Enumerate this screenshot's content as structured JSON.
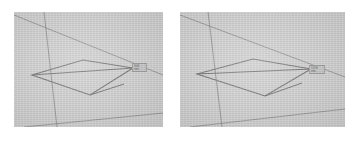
{
  "scene": {
    "title": "3D wireframe viewport pair",
    "background_color": "#ffffff",
    "viewport_fill": "#c9c9c9",
    "line_color": "#6e6e6e",
    "label_text_color": "#4a4a4a",
    "label_fill_color": "#bcbcbc"
  },
  "panels": [
    {
      "name": "left-viewport",
      "x": 14,
      "y": 12,
      "width": 149,
      "height": 115,
      "axes": [
        {
          "name": "vertical-axis",
          "x1": 30,
          "y1": 0,
          "x2": 43,
          "y2": 115
        },
        {
          "name": "horizon-diagonal",
          "x1": 0,
          "y1": 3,
          "x2": 149,
          "y2": 63
        },
        {
          "name": "ground-diagonal",
          "x1": 10,
          "y1": 115,
          "x2": 149,
          "y2": 101
        }
      ],
      "quad": {
        "name": "wireframe-quad",
        "points": "18,63 69,48 119,56 76,83"
      },
      "diagonal": {
        "name": "quad-diagonal",
        "x1": 18,
        "y1": 63,
        "x2": 119,
        "y2": 56
      },
      "spur": {
        "name": "quad-spur",
        "x1": 76,
        "y1": 83,
        "x2": 110,
        "y2": 72
      },
      "label": {
        "name": "dimension-label",
        "x": 118,
        "y": 51,
        "width": 13,
        "height": 7,
        "line1": "8.46",
        "line2": "mm"
      }
    },
    {
      "name": "right-viewport",
      "x": 180,
      "y": 12,
      "width": 165,
      "height": 115,
      "axes": [
        {
          "name": "vertical-axis",
          "x1": 28,
          "y1": 0,
          "x2": 42,
          "y2": 115
        },
        {
          "name": "horizon-diagonal",
          "x1": 0,
          "y1": 3,
          "x2": 165,
          "y2": 65
        },
        {
          "name": "ground-diagonal",
          "x1": 10,
          "y1": 115,
          "x2": 165,
          "y2": 97
        }
      ],
      "quad": {
        "name": "wireframe-quad",
        "points": "17,62 73,47 131,57 85,84"
      },
      "diagonal": {
        "name": "quad-diagonal",
        "x1": 17,
        "y1": 62,
        "x2": 131,
        "y2": 57
      },
      "spur": {
        "name": "quad-spur",
        "x1": 85,
        "y1": 84,
        "x2": 122,
        "y2": 71
      },
      "label": {
        "name": "dimension-label",
        "x": 129,
        "y": 53,
        "width": 14,
        "height": 7,
        "line1": "12.94",
        "line2": "mm"
      }
    }
  ]
}
